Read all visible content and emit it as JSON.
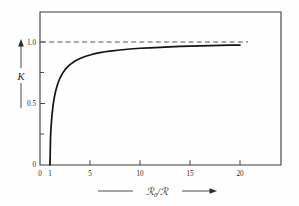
{
  "chart_data": {
    "type": "line",
    "title": "",
    "subtitle": "",
    "xlabel": "R0/R",
    "xlabel_parts": {
      "symbol": "ℛ",
      "subscript": "0",
      "divider": "/",
      "symbol2": "ℛ"
    },
    "ylabel": "K",
    "xlim": [
      0,
      24
    ],
    "ylim": [
      0,
      1.18
    ],
    "xticks": [
      0,
      1,
      5,
      10,
      15,
      20
    ],
    "xtick_labels": [
      "0",
      "1",
      "5",
      "10",
      "15",
      "20"
    ],
    "yticks": [
      0,
      0.25,
      0.5,
      0.75,
      1.0
    ],
    "ytick_labels": [
      "0",
      "",
      "0.5",
      "",
      "1.0"
    ],
    "grid": false,
    "legend": null,
    "annotations": [
      {
        "name": "asymptote",
        "type": "dashed-horizontal-line",
        "y": 1.0,
        "x_start": 0,
        "x_end": 20.8
      },
      {
        "name": "y-axis-arrow",
        "type": "arrow",
        "direction": "up",
        "label": "K"
      },
      {
        "name": "x-axis-arrow",
        "type": "arrow",
        "direction": "right",
        "label": "R0/R"
      }
    ],
    "series": [
      {
        "name": "K",
        "formula": "K = sqrt(1 - 1/(R0/R))",
        "x": [
          1.0,
          1.05,
          1.1,
          1.2,
          1.3,
          1.4,
          1.5,
          1.6,
          1.8,
          2.0,
          2.25,
          2.5,
          2.75,
          3.0,
          3.5,
          4.0,
          4.5,
          5.0,
          5.5,
          6.0,
          6.5,
          7.0,
          8.0,
          9.0,
          10.0,
          11.0,
          12.0,
          13.0,
          14.0,
          15.0,
          16.0,
          17.0,
          18.0,
          19.0,
          20.0
        ],
        "values": [
          0.0,
          0.218,
          0.302,
          0.408,
          0.48,
          0.535,
          0.577,
          0.612,
          0.667,
          0.707,
          0.745,
          0.775,
          0.798,
          0.816,
          0.845,
          0.866,
          0.882,
          0.894,
          0.905,
          0.913,
          0.921,
          0.926,
          0.935,
          0.943,
          0.949,
          0.953,
          0.957,
          0.961,
          0.964,
          0.966,
          0.968,
          0.97,
          0.972,
          0.974,
          0.975
        ]
      }
    ]
  },
  "figure": {
    "caption": "",
    "background_color": "#fefefe",
    "curve_color": "#141414",
    "axis_color": "#3a3a3a",
    "asymptote_color": "#555555"
  }
}
